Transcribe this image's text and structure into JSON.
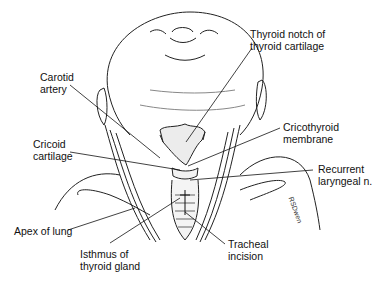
{
  "diagram": {
    "labels": [
      {
        "id": "thyroid-notch",
        "line1": "Thyroid notch of",
        "line2": "thyroid cartilage"
      },
      {
        "id": "carotid-artery",
        "line1": "Carotid",
        "line2": "artery"
      },
      {
        "id": "cricothyroid-membrane",
        "line1": "Cricothyroid",
        "line2": "membrane"
      },
      {
        "id": "cricoid-cartilage",
        "line1": "Cricoid",
        "line2": "cartilage"
      },
      {
        "id": "recurrent-laryngeal",
        "line1": "Recurrent",
        "line2": "laryngeal n."
      },
      {
        "id": "apex-of-lung",
        "line1": "Apex of lung",
        "line2": ""
      },
      {
        "id": "tracheal-incision",
        "line1": "Tracheal",
        "line2": "incision"
      },
      {
        "id": "isthmus",
        "line1": "Isthmus of",
        "line2": "thyroid gland"
      }
    ],
    "signature": "RSDwen"
  }
}
